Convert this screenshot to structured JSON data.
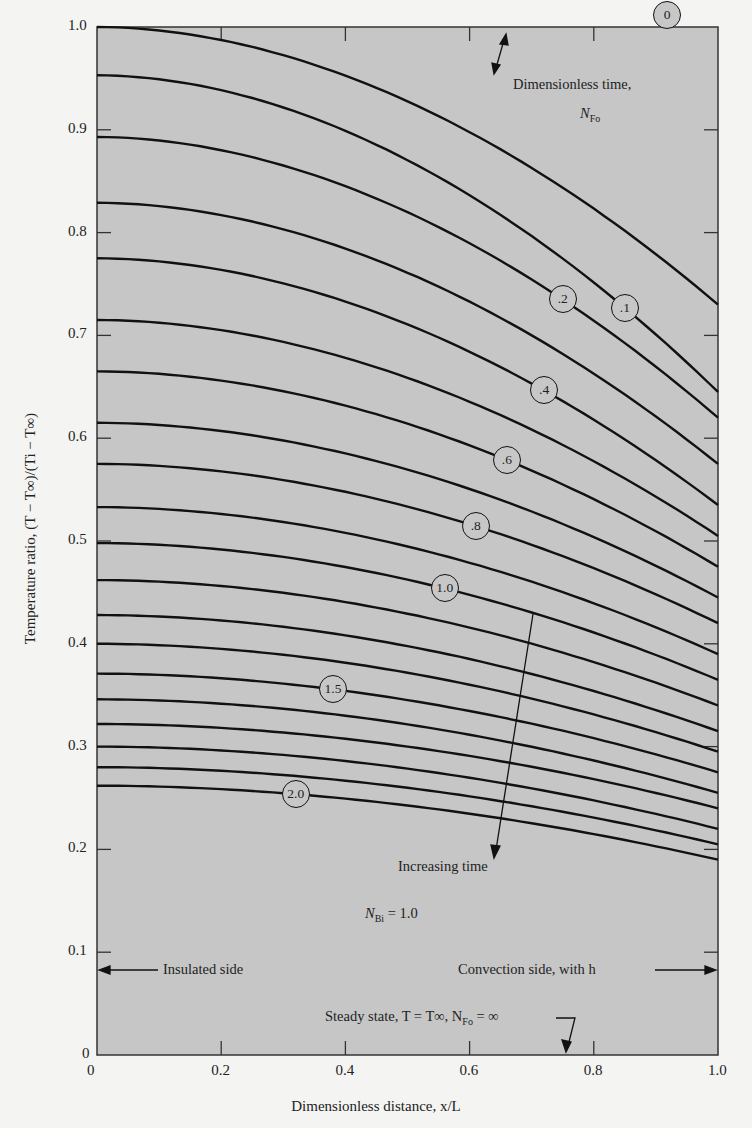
{
  "chart_data": {
    "type": "line",
    "title": "",
    "xlabel": "Dimensionless distance, x/L",
    "ylabel": "Temperature ratio, (T − T∞)/(Ti − T∞)",
    "xlim": [
      0,
      1.0
    ],
    "ylim": [
      0,
      1.0
    ],
    "grid": false,
    "x_ticks": [
      "0",
      "0.2",
      "0.4",
      "0.6",
      "0.8",
      "1.0"
    ],
    "y_ticks": [
      "0",
      "0.1",
      "0.2",
      "0.3",
      "0.4",
      "0.5",
      "0.6",
      "0.7",
      "0.8",
      "0.9",
      "1.0"
    ],
    "x": [
      0,
      0.1,
      0.2,
      0.3,
      0.4,
      0.5,
      0.6,
      0.7,
      0.8,
      0.9,
      1.0
    ],
    "series_note": "Family of curves for dimensionless time N_Fo; curves labeled 0, .1, .2, .4, .6, .8, 1.0, 1.5, 2.0",
    "series": [
      {
        "name": "0",
        "label": "0",
        "left": 1.0,
        "right": 0.73
      },
      {
        "name": "0.1",
        "label": ".1",
        "left": 0.953,
        "right": 0.645
      },
      {
        "name": "0.2",
        "label": ".2",
        "left": 0.893,
        "right": 0.62
      },
      {
        "name": "0.3",
        "label": "",
        "left": 0.829,
        "right": 0.575
      },
      {
        "name": "0.4",
        "label": ".4",
        "left": 0.775,
        "right": 0.535
      },
      {
        "name": "0.5",
        "label": "",
        "left": 0.715,
        "right": 0.505
      },
      {
        "name": "0.6",
        "label": ".6",
        "left": 0.665,
        "right": 0.475
      },
      {
        "name": "0.7",
        "label": "",
        "left": 0.615,
        "right": 0.445
      },
      {
        "name": "0.8",
        "label": ".8",
        "left": 0.575,
        "right": 0.42
      },
      {
        "name": "0.9",
        "label": "",
        "left": 0.533,
        "right": 0.39
      },
      {
        "name": "1.0",
        "label": "1.0",
        "left": 0.498,
        "right": 0.365
      },
      {
        "name": "1.1",
        "label": "",
        "left": 0.462,
        "right": 0.34
      },
      {
        "name": "1.2",
        "label": "",
        "left": 0.428,
        "right": 0.315
      },
      {
        "name": "1.3",
        "label": "",
        "left": 0.4,
        "right": 0.295
      },
      {
        "name": "1.5",
        "label": "1.5",
        "left": 0.371,
        "right": 0.275
      },
      {
        "name": "1.6",
        "label": "",
        "left": 0.346,
        "right": 0.255
      },
      {
        "name": "1.7",
        "label": "",
        "left": 0.322,
        "right": 0.24
      },
      {
        "name": "1.8",
        "label": "",
        "left": 0.3,
        "right": 0.22
      },
      {
        "name": "1.9",
        "label": "",
        "left": 0.28,
        "right": 0.205
      },
      {
        "name": "2.0",
        "label": "2.0",
        "left": 0.262,
        "right": 0.19
      }
    ],
    "annotations": {
      "dimensionless_time": "Dimensionless time,",
      "nfo": "N",
      "nfo_sub": "Fo",
      "increasing_time": "Increasing time",
      "nbi_label": "N",
      "nbi_sub": "Bi",
      "nbi_value": "= 1.0",
      "insulated": "Insulated side",
      "convection": "Convection side, with h",
      "steady_state": "Steady state, T = T∞, N",
      "steady_sub": "Fo",
      "steady_tail": "= ∞"
    },
    "colors": {
      "plot_bg": "#c6c6c6",
      "line": "#111111",
      "page_bg": "#f4f4f2"
    }
  }
}
